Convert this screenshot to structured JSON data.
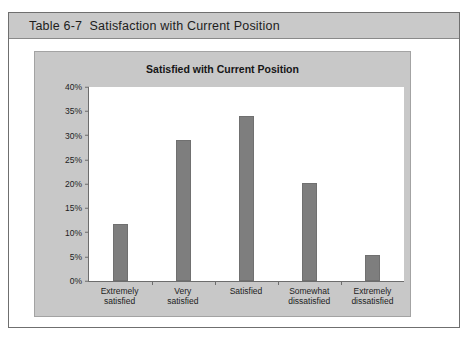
{
  "caption": {
    "label": "Table 6-7",
    "title": "Satisfaction with Current Position",
    "full": "Table 6-7  Satisfaction with Current Position"
  },
  "colors": {
    "bar": "#7e7e7e",
    "panel": "#c8c8c8",
    "caption_bar": "#c9c9c9",
    "plot_background": "#ffffff",
    "axis": "#6d6d6d",
    "frame": "#6f6f6f"
  },
  "chart_data": {
    "type": "bar",
    "title": "Satisfied with Current Position",
    "xlabel": "",
    "ylabel": "",
    "categories": [
      "Extremely\nsatisfied",
      "Very\nsatisfied",
      "Satisfied",
      "Somewhat\ndissatisfied",
      "Extremely\ndissatisfied"
    ],
    "category_lines": [
      [
        "Extremely",
        "satisfied"
      ],
      [
        "Very",
        "satisfied"
      ],
      [
        "Satisfied",
        ""
      ],
      [
        "Somewhat",
        "dissatisfied"
      ],
      [
        "Extremely",
        "dissatisfied"
      ]
    ],
    "values": [
      11.7,
      29.0,
      34.0,
      20.3,
      5.4
    ],
    "ylim": [
      0,
      40
    ],
    "ytick_values": [
      40,
      35,
      30,
      25,
      20,
      15,
      10,
      5,
      0
    ],
    "ytick_labels": [
      "40%",
      "35%",
      "30%",
      "25%",
      "20%",
      "15%",
      "10%",
      "5%",
      "0%"
    ],
    "grid": false,
    "legend": false
  }
}
